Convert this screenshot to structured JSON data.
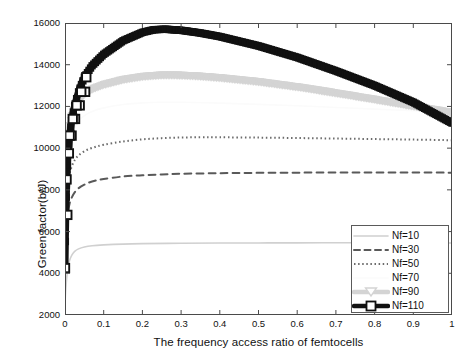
{
  "chart_data": {
    "type": "line",
    "title": "",
    "xlabel": "The frequency access ratio of femtocells",
    "ylabel": "Green factor(b/J)",
    "xlim": [
      0,
      1
    ],
    "ylim": [
      2000,
      16000
    ],
    "xticks": [
      "0",
      "0.1",
      "0.2",
      "0.3",
      "0.4",
      "0.5",
      "0.6",
      "0.7",
      "0.8",
      "0.9",
      "1"
    ],
    "yticks": [
      "2000",
      "4000",
      "6000",
      "8000",
      "10000",
      "12000",
      "14000",
      "16000"
    ],
    "grid": false,
    "legend_position": "lower right",
    "series": [
      {
        "name": "Nf=10",
        "color": "#d0d0d0",
        "style": "solid",
        "width": 1.6,
        "marker": "none",
        "x": [
          0.0,
          0.002,
          0.005,
          0.008,
          0.012,
          0.018,
          0.025,
          0.035,
          0.05,
          0.07,
          0.1,
          0.15,
          0.2,
          0.3,
          0.4,
          0.5,
          0.6,
          0.7,
          0.8,
          0.9,
          1.0
        ],
        "y": [
          2550,
          3250,
          3900,
          4320,
          4620,
          4880,
          5050,
          5170,
          5260,
          5320,
          5360,
          5400,
          5420,
          5440,
          5450,
          5455,
          5460,
          5462,
          5464,
          5462,
          5455
        ]
      },
      {
        "name": "Nf=30",
        "color": "#595959",
        "style": "dashed",
        "width": 2.0,
        "marker": "none",
        "x": [
          0.0,
          0.002,
          0.005,
          0.008,
          0.012,
          0.018,
          0.025,
          0.035,
          0.05,
          0.07,
          0.1,
          0.15,
          0.2,
          0.25,
          0.3,
          0.4,
          0.5,
          0.6,
          0.7,
          0.8,
          0.9,
          1.0
        ],
        "y": [
          4200,
          5450,
          6400,
          6950,
          7350,
          7650,
          7880,
          8080,
          8250,
          8400,
          8520,
          8640,
          8700,
          8740,
          8770,
          8800,
          8815,
          8825,
          8830,
          8832,
          8830,
          8825
        ]
      },
      {
        "name": "Nf=50",
        "color": "#6b6b6b",
        "style": "dotted",
        "width": 2.0,
        "marker": "none",
        "x": [
          0.0,
          0.002,
          0.005,
          0.008,
          0.012,
          0.018,
          0.025,
          0.035,
          0.05,
          0.07,
          0.1,
          0.15,
          0.2,
          0.25,
          0.3,
          0.35,
          0.4,
          0.5,
          0.6,
          0.7,
          0.8,
          0.9,
          1.0
        ],
        "y": [
          5200,
          6700,
          7750,
          8350,
          8800,
          9150,
          9420,
          9650,
          9850,
          10010,
          10160,
          10320,
          10420,
          10480,
          10510,
          10520,
          10520,
          10505,
          10485,
          10460,
          10435,
          10410,
          10380
        ]
      },
      {
        "name": "Nf=70",
        "color": "#fbfbfb",
        "style": "solid",
        "width": 1.6,
        "marker": "none",
        "x": [
          0.0,
          0.002,
          0.005,
          0.008,
          0.012,
          0.018,
          0.025,
          0.035,
          0.05,
          0.07,
          0.1,
          0.15,
          0.2,
          0.25,
          0.3,
          0.4,
          0.5,
          0.6,
          0.7,
          0.8,
          0.9,
          1.0
        ],
        "y": [
          6100,
          7800,
          9000,
          9700,
          10200,
          10650,
          11000,
          11300,
          11560,
          11760,
          11930,
          12090,
          12170,
          12200,
          12200,
          12160,
          12100,
          12030,
          11950,
          11870,
          11790,
          11700
        ]
      },
      {
        "name": "Nf=90",
        "color": "#d4d4d4",
        "style": "solid",
        "width": 6.5,
        "marker": "triangle-down",
        "x": [
          0.0,
          0.002,
          0.005,
          0.008,
          0.012,
          0.018,
          0.025,
          0.035,
          0.05,
          0.07,
          0.1,
          0.15,
          0.2,
          0.25,
          0.3,
          0.35,
          0.4,
          0.5,
          0.6,
          0.7,
          0.8,
          0.9,
          1.0
        ],
        "y": [
          6400,
          8400,
          9750,
          10520,
          11080,
          11560,
          11960,
          12290,
          12590,
          12830,
          13040,
          13280,
          13430,
          13500,
          13490,
          13440,
          13370,
          13180,
          12930,
          12640,
          12330,
          12010,
          11700
        ]
      },
      {
        "name": "Nf=110",
        "color": "#111111",
        "style": "solid",
        "width": 7.0,
        "marker": "square",
        "x": [
          0.0,
          0.002,
          0.005,
          0.008,
          0.012,
          0.018,
          0.025,
          0.035,
          0.05,
          0.07,
          0.1,
          0.15,
          0.2,
          0.23,
          0.26,
          0.3,
          0.35,
          0.4,
          0.5,
          0.6,
          0.7,
          0.8,
          0.9,
          1.0
        ],
        "y": [
          4250,
          6800,
          8500,
          9750,
          10600,
          11400,
          12050,
          12700,
          13400,
          13950,
          14500,
          15150,
          15550,
          15680,
          15700,
          15650,
          15520,
          15350,
          14900,
          14350,
          13700,
          13000,
          12200,
          11200
        ]
      }
    ],
    "marker_x_110": [
      0.004,
      0.01,
      0.017,
      0.026,
      0.038,
      0.052
    ],
    "marker_y_110": [
      8500,
      9750,
      10600,
      11400,
      12050,
      12700
    ]
  },
  "legend": {
    "items": [
      {
        "label": "Nf=10"
      },
      {
        "label": "Nf=30"
      },
      {
        "label": "Nf=50"
      },
      {
        "label": "Nf=70"
      },
      {
        "label": "Nf=90"
      },
      {
        "label": "Nf=110"
      }
    ]
  }
}
